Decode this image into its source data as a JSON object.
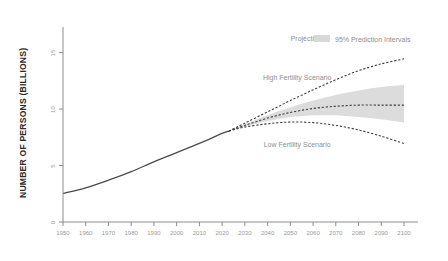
{
  "chart_data": {
    "type": "line",
    "title": "",
    "xlabel": "",
    "ylabel": "NUMBER OF PERSONS (BILLIONS)",
    "xlim": [
      1950,
      2100
    ],
    "ylim": [
      0,
      17
    ],
    "grid": false,
    "legend_position": "top-right",
    "x_ticks": [
      "1950",
      "1960",
      "1970",
      "1980",
      "1990",
      "2000",
      "2010",
      "2020",
      "2030",
      "2040",
      "2050",
      "2060",
      "2070",
      "2080",
      "2090",
      "2100"
    ],
    "y_ticks": [
      "0",
      "5",
      "10",
      "15"
    ],
    "annotations": [
      {
        "name": "projection-label",
        "text": "Projection",
        "x": 2057,
        "y": 16.0
      },
      {
        "name": "high-fertility-label",
        "text": "High Fertility Scenario",
        "x": 2053,
        "y": 12.6
      },
      {
        "name": "low-fertility-label",
        "text": "Low Fertility Scenario",
        "x": 2053,
        "y": 6.6
      }
    ],
    "legend": [
      {
        "name": "prediction-interval",
        "label": "95% Prediction Intervals",
        "color": "#d8d8d8",
        "marker": "band"
      }
    ],
    "series": [
      {
        "name": "Historical (estimates)",
        "style": "solid",
        "color": "#4a4a4a",
        "x": [
          1950,
          1960,
          1970,
          1980,
          1990,
          2000,
          2010,
          2020,
          2023
        ],
        "values": [
          2.54,
          3.03,
          3.7,
          4.46,
          5.33,
          6.14,
          6.96,
          7.84,
          8.05
        ]
      },
      {
        "name": "Median projection",
        "style": "dashed",
        "color": "#3c3c3c",
        "x": [
          2023,
          2030,
          2040,
          2050,
          2060,
          2070,
          2080,
          2090,
          2100
        ],
        "values": [
          8.05,
          8.55,
          9.2,
          9.7,
          10.05,
          10.25,
          10.35,
          10.35,
          10.35
        ]
      },
      {
        "name": "High Fertility Scenario",
        "style": "dashed",
        "color": "#3c3c3c",
        "x": [
          2023,
          2030,
          2040,
          2050,
          2060,
          2070,
          2080,
          2090,
          2100
        ],
        "values": [
          8.05,
          8.75,
          9.75,
          10.75,
          11.7,
          12.6,
          13.4,
          14.0,
          14.45
        ]
      },
      {
        "name": "Low Fertility Scenario",
        "style": "dashed",
        "color": "#3c3c3c",
        "x": [
          2023,
          2030,
          2040,
          2050,
          2060,
          2070,
          2080,
          2090,
          2100
        ],
        "values": [
          8.05,
          8.4,
          8.7,
          8.85,
          8.8,
          8.55,
          8.15,
          7.6,
          6.95
        ]
      }
    ],
    "prediction_interval": {
      "label": "95% Prediction Intervals",
      "x": [
        2023,
        2030,
        2040,
        2050,
        2060,
        2070,
        2080,
        2090,
        2100
      ],
      "upper": [
        8.05,
        8.65,
        9.45,
        10.15,
        10.75,
        11.25,
        11.65,
        11.95,
        12.15
      ],
      "lower": [
        8.05,
        8.45,
        8.95,
        9.3,
        9.45,
        9.45,
        9.3,
        9.1,
        8.8
      ]
    }
  }
}
